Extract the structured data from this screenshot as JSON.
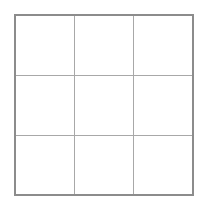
{
  "board": {
    "rows": 3,
    "cols": 3,
    "cells": [
      [
        "",
        "",
        ""
      ],
      [
        "",
        "",
        ""
      ],
      [
        "",
        "",
        ""
      ]
    ],
    "colors": {
      "outer_border": "#8c8c8c",
      "grid_line": "#a8a8a8",
      "background": "#ffffff"
    }
  }
}
